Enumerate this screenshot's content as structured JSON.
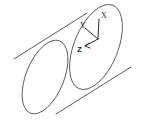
{
  "figure": {
    "background_color": "#ffffff",
    "stroke_color": "#4a4a4f",
    "axis_color": "#2a2a2e",
    "width": 141,
    "height": 124
  },
  "cylinder": {
    "name": "cylinder-solid",
    "near_face_label": "near-ellipse",
    "far_face_label": "far-ellipse",
    "near_ellipse": {
      "cx": 96,
      "cy": 47,
      "rx": 22,
      "ry": 45,
      "rotation_deg": 22
    },
    "far_ellipse": {
      "cx": 45,
      "cy": 77,
      "rx": 19,
      "ry": 39,
      "rotation_deg": 22
    },
    "ruling_top": {
      "x1": 14,
      "y1": 59,
      "x2": 87,
      "y2": 13
    },
    "ruling_bottom": {
      "x1": 56,
      "y1": 114,
      "x2": 131,
      "y2": 67
    }
  },
  "axes": {
    "name": "coordinate-triad",
    "origin": {
      "x": 98,
      "y": 39
    },
    "items": [
      {
        "id": "x",
        "label": "X",
        "direction": "up",
        "tip": {
          "x": 99,
          "y": 19
        },
        "label_pos": {
          "x": 101,
          "y": 17
        },
        "bold": false
      },
      {
        "id": "y",
        "label": "Y",
        "direction": "upper-left",
        "tip": {
          "x": 85,
          "y": 28
        },
        "label_pos": {
          "x": 82,
          "y": 27
        },
        "bold": false
      },
      {
        "id": "z",
        "label": "Z",
        "direction": "lower-left",
        "tip": {
          "x": 85,
          "y": 46
        },
        "label_pos": {
          "x": 79,
          "y": 50
        },
        "bold": true
      }
    ]
  }
}
